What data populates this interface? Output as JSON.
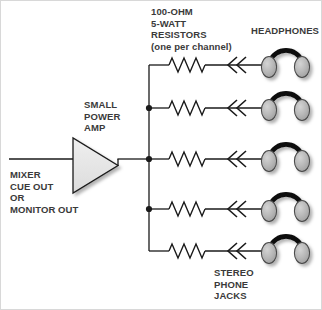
{
  "diagram": {
    "background_color": "#ffffff",
    "line_color": "#1a1a1a",
    "text_color": "#3a3a3a",
    "amp_fill_color": "#e8e8e8",
    "earcup_fill_color": "#b4b4b4",
    "headband_color": "#111111"
  },
  "labels": {
    "resistors": "100-OHM\n5-WATT\nRESISTORS\n(one per channel)",
    "headphones": "HEADPHONES",
    "amp": "SMALL\nPOWER\nAMP",
    "source": "MIXER\nCUE OUT\nOR\nMONITOR OUT",
    "jacks": "STEREO\nPHONE\nJACKS"
  },
  "components": {
    "amp": {
      "name": "SMALL POWER AMP",
      "shape": "triangle",
      "input_label": "MIXER CUE OUT OR MONITOR OUT"
    },
    "resistor": {
      "value": "100-OHM",
      "power": "5-WATT",
      "note": "one per channel",
      "count": 5
    },
    "jack": {
      "name": "STEREO PHONE JACKS",
      "symbol": "<<",
      "count": 5
    },
    "headphones": {
      "count": 5
    }
  },
  "channels": [
    {
      "index": 1,
      "y": 64,
      "junction": false
    },
    {
      "index": 2,
      "y": 107,
      "junction": true
    },
    {
      "index": 3,
      "y": 158,
      "junction": true
    },
    {
      "index": 4,
      "y": 208,
      "junction": true
    },
    {
      "index": 5,
      "y": 250,
      "junction": false
    }
  ]
}
